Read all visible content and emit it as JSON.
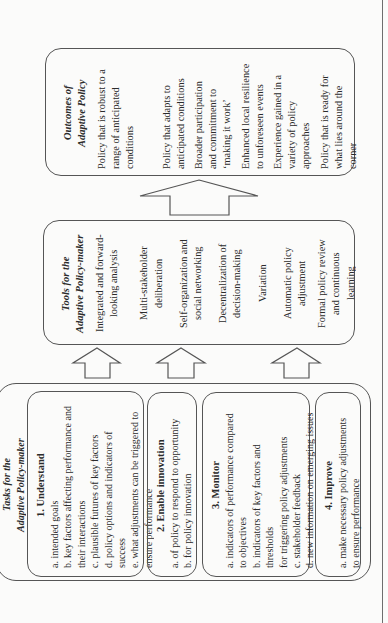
{
  "outcomes": {
    "title_line1": "Outcomes of",
    "title_line2": "Adaptive Policy",
    "items": [
      [
        "Policy that is robust to a",
        "range of anticipated",
        "conditions"
      ],
      [
        "Policy that adapts to",
        "anticipated conditions"
      ],
      [
        "Broader participation",
        "and commitment to",
        "‘making it work’"
      ],
      [
        "Enhanced local resilience",
        "to unforeseen events"
      ],
      [
        "Experience gained in a",
        "variety of policy",
        "approaches"
      ],
      [
        "Policy that is ready for",
        "what lies around the",
        "corner"
      ]
    ]
  },
  "tools": {
    "title_line1": "Tools for the",
    "title_line2": "Adaptive Policy-maker",
    "items": [
      [
        "Integrated and forward-",
        "looking analysis"
      ],
      [
        "Multi-stakeholder",
        "deliberation"
      ],
      [
        "Self-organization and",
        "social networking"
      ],
      [
        "Decentralization of",
        "decision-making"
      ],
      [
        "Variation"
      ],
      [
        "Automatic policy",
        "adjustment"
      ],
      [
        "Formal policy review",
        "and continuous",
        "learning"
      ]
    ]
  },
  "tasks": {
    "title_line1": "Tasks for the",
    "title_line2": "Adaptive Policy-maker",
    "sections": [
      {
        "title": "1. Understand",
        "lines": [
          "a. intended goals",
          "b. key factors affecting performance and",
          "their interactions",
          "c. plausible futures of key factors",
          "d. policy options and indicators of success",
          "e. what adjustments can be triggered to",
          "ensure performance"
        ]
      },
      {
        "title": "2. Enable innovation",
        "lines": [
          "a. of policy to respond to opportunity",
          "b. for policy innovation"
        ]
      },
      {
        "title": "3. Monitor",
        "lines": [
          "a. indicators of performance compared",
          "to objectives",
          "b. indicators of key factors and  thresholds",
          "for triggering policy adjustments",
          "c. stakeholder feedback",
          "d. new information on emerging issues"
        ]
      },
      {
        "title": "4. Improve",
        "lines": [
          "a. make necessary policy adjustments",
          "to ensure performance"
        ]
      }
    ]
  },
  "colors": {
    "line": "#555555",
    "text": "#2b2b2b",
    "background": "#fbfbfa"
  }
}
